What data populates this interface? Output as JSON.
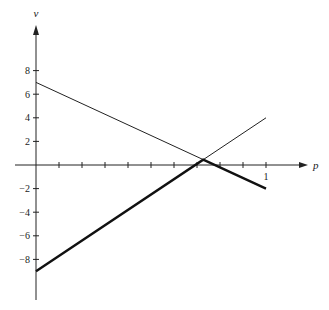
{
  "chart_data": {
    "type": "line",
    "title": "",
    "xlabel": "p",
    "ylabel": "v",
    "xlim": [
      0,
      1
    ],
    "ylim": [
      -10,
      9
    ],
    "x_ticks": [
      0,
      0.1,
      0.2,
      0.3,
      0.4,
      0.5,
      0.6,
      0.7,
      0.8,
      0.9,
      1
    ],
    "x_tick_labels": [
      {
        "value": 1,
        "label": "1"
      }
    ],
    "y_tick_labels": [
      {
        "value": 8,
        "label": "8"
      },
      {
        "value": 6,
        "label": "6"
      },
      {
        "value": 4,
        "label": "4"
      },
      {
        "value": 2,
        "label": "2"
      },
      {
        "value": -2,
        "label": "−2"
      },
      {
        "value": -4,
        "label": "−4"
      },
      {
        "value": -6,
        "label": "−6"
      },
      {
        "value": -8,
        "label": "−8"
      }
    ],
    "grid": false,
    "legend": null,
    "series": [
      {
        "name": "line-falling",
        "x": [
          0,
          1
        ],
        "values": [
          7,
          -2
        ]
      },
      {
        "name": "line-rising",
        "x": [
          0,
          1
        ],
        "values": [
          -9,
          4
        ]
      }
    ],
    "lower_envelope": {
      "emphasis": "thick",
      "x": [
        0,
        0.727,
        1
      ],
      "values": [
        -9,
        0.45,
        -2
      ]
    }
  }
}
